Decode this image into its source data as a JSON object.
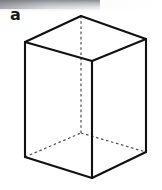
{
  "figure": {
    "label": "a",
    "shape_name": "rectangular-prism",
    "canvas": {
      "width": 162,
      "height": 190,
      "background": "#ffffff"
    },
    "colors": {
      "visible_edge": "#111111",
      "hidden_edge": "#555555",
      "face": "#ffffff",
      "label_text": "#1a1a1a"
    },
    "vertices": {
      "top_left": [
        25,
        42
      ],
      "top_back": [
        81,
        16
      ],
      "top_right": [
        146,
        39
      ],
      "top_front": [
        92,
        61
      ],
      "bottom_left": [
        25,
        157
      ],
      "bottom_back": [
        81,
        133
      ],
      "bottom_right": [
        146,
        152
      ],
      "bottom_front": [
        92,
        178
      ]
    },
    "visible_edges": [
      {
        "name": "top-face-left-back",
        "from": "top_left",
        "to": "top_back"
      },
      {
        "name": "top-face-right-back",
        "from": "top_back",
        "to": "top_right"
      },
      {
        "name": "top-face-left-front",
        "from": "top_left",
        "to": "top_front"
      },
      {
        "name": "top-face-right-front",
        "from": "top_front",
        "to": "top_right"
      },
      {
        "name": "vertical-left",
        "from": "top_left",
        "to": "bottom_left"
      },
      {
        "name": "vertical-front",
        "from": "top_front",
        "to": "bottom_front"
      },
      {
        "name": "vertical-right",
        "from": "top_right",
        "to": "bottom_right"
      },
      {
        "name": "bottom-face-left-front",
        "from": "bottom_left",
        "to": "bottom_front"
      },
      {
        "name": "bottom-face-right-front",
        "from": "bottom_front",
        "to": "bottom_right"
      }
    ],
    "hidden_edges": [
      {
        "name": "vertical-back-hidden",
        "from": "top_back",
        "to": "bottom_back"
      },
      {
        "name": "bottom-face-left-back-hidden",
        "from": "bottom_left",
        "to": "bottom_back"
      },
      {
        "name": "bottom-face-right-back-hidden",
        "from": "bottom_back",
        "to": "bottom_right"
      }
    ],
    "artifacts": {
      "top_left_scan_shadow": true
    }
  }
}
